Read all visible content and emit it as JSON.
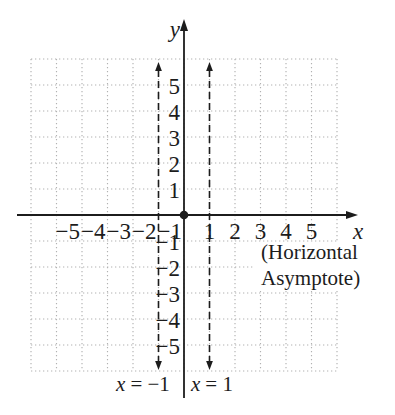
{
  "colors": {
    "background": "#ffffff",
    "grid": "#b2b2b2",
    "ink": "#1c1c1c"
  },
  "axes": {
    "x_label": "x",
    "y_label": "y",
    "x_ticks_negative": [
      "−5",
      "−4",
      "−3",
      "−2",
      "−1"
    ],
    "x_ticks_positive": [
      "1",
      "2",
      "3",
      "4",
      "5"
    ],
    "y_ticks_positive": [
      "5",
      "4",
      "3",
      "2",
      "1"
    ],
    "y_ticks_negative": [
      "−1",
      "−2",
      "−3",
      "−4",
      "−5"
    ]
  },
  "annotations": {
    "horizontal_asymptote_line1": "(Horizontal",
    "horizontal_asymptote_line2": "Asymptote)",
    "vertical_asymptote_left": {
      "var": "x",
      "rest": "= −1"
    },
    "vertical_asymptote_right": {
      "var": "x",
      "rest": "= 1"
    }
  }
}
